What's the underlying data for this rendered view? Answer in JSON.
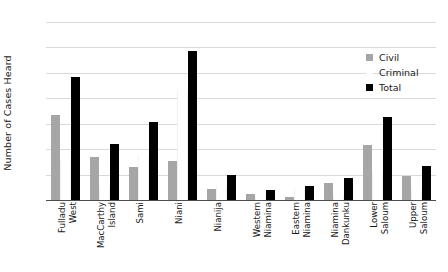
{
  "chart_data": {
    "type": "bar",
    "title": "",
    "xlabel": "",
    "ylabel": "Number of Cases Heard",
    "ylim": [
      0,
      140
    ],
    "yticks": [
      0,
      20,
      40,
      60,
      80,
      100,
      120,
      140
    ],
    "grid": true,
    "legend_position": "upper-right",
    "categories": [
      "Fulladu West",
      "MacCarthy Island",
      "Sami",
      "Niani",
      "Nianija",
      "Western Niamina",
      "Eastern Niamina",
      "Niamina Dankunku",
      "Lower Saloum",
      "Upper Saloum"
    ],
    "category_lines": [
      [
        "Fulladu",
        "West"
      ],
      [
        "MacCarthy",
        "Island"
      ],
      [
        "Sami",
        ""
      ],
      [
        "Niani",
        ""
      ],
      [
        "Nianija",
        ""
      ],
      [
        "Western",
        "Niamina"
      ],
      [
        "Eastern",
        "Niamina"
      ],
      [
        "Niamina",
        "Dankunku"
      ],
      [
        "Lower",
        "Saloum"
      ],
      [
        "Upper",
        "Saloum"
      ]
    ],
    "series": [
      {
        "name": "Civil",
        "color": "#a6a6a6",
        "values": [
          67,
          34,
          26,
          31,
          9,
          5,
          2,
          13,
          43,
          19
        ]
      },
      {
        "name": "Criminal",
        "color": "#ffffff",
        "values": [
          31,
          10,
          35,
          86,
          11,
          3,
          9,
          4,
          22,
          8
        ]
      },
      {
        "name": "Total",
        "color": "#000000",
        "values": [
          97,
          44,
          61,
          117,
          20,
          8,
          11,
          17,
          65,
          27
        ]
      }
    ]
  },
  "legend": {
    "items": [
      {
        "label": "Civil",
        "swatch": "civil-swatch"
      },
      {
        "label": "Criminal",
        "swatch": "criminal-swatch"
      },
      {
        "label": "Total",
        "swatch": "total-swatch"
      }
    ]
  }
}
